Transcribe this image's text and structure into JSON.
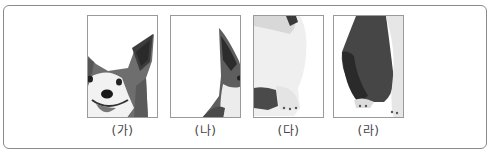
{
  "figure": {
    "panels": [
      {
        "label": "(가)",
        "content": "corgi head with ear, eyes, nose, smiling mouth"
      },
      {
        "label": "(나)",
        "content": "corgi ear and cheek edge"
      },
      {
        "label": "(다)",
        "content": "corgi white chest and front paws"
      },
      {
        "label": "(라)",
        "content": "corgi dark side body and paws"
      }
    ]
  },
  "colors": {
    "border": "#8a8a8a",
    "panel_border": "#9a9a9a",
    "fur_dark": "#5a5a5a",
    "fur_mid": "#8c8c8c",
    "fur_light": "#e8e8e8",
    "caption": "#444444"
  }
}
